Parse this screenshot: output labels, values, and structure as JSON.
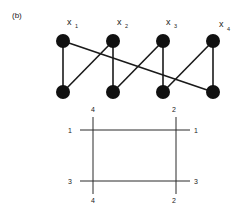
{
  "panel_label": "(b)",
  "graph": {
    "top_nodes": [
      {
        "id": "x1",
        "label": "x",
        "sub": "1",
        "cx": 63,
        "cy": 41
      },
      {
        "id": "x2",
        "label": "x",
        "sub": "2",
        "cx": 113,
        "cy": 41
      },
      {
        "id": "x3",
        "label": "x",
        "sub": "3",
        "cx": 163,
        "cy": 41
      },
      {
        "id": "x4",
        "label": "x",
        "sub": "4",
        "cx": 213,
        "cy": 41
      }
    ],
    "bottom_nodes": [
      {
        "id": "b1",
        "cx": 63,
        "cy": 92
      },
      {
        "id": "b2",
        "cx": 113,
        "cy": 92
      },
      {
        "id": "b3",
        "cx": 163,
        "cy": 92
      },
      {
        "id": "b4",
        "cx": 213,
        "cy": 92
      }
    ],
    "edges": [
      [
        "x1",
        "b1"
      ],
      [
        "x2",
        "b2"
      ],
      [
        "x3",
        "b3"
      ],
      [
        "x4",
        "b4"
      ],
      [
        "x1",
        "b4"
      ],
      [
        "x2",
        "b1"
      ],
      [
        "x3",
        "b2"
      ],
      [
        "x4",
        "b3"
      ]
    ]
  },
  "rectangle": {
    "left_line_label_top": "4",
    "left_line_label_bottom": "4",
    "right_line_label_top": "2",
    "right_line_label_bottom": "2",
    "top_line_label_left": "1",
    "top_line_label_right": "1",
    "bottom_line_label_left": "3",
    "bottom_line_label_right": "3"
  },
  "colors": {
    "line": "#1a1a1a",
    "node": "#111111",
    "text": "#222222"
  }
}
